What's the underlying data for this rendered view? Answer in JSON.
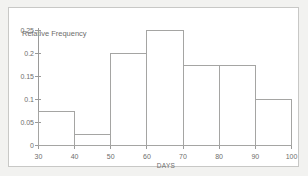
{
  "chart_data": {
    "type": "bar",
    "title": "",
    "subtitle": "",
    "xlabel": "DAYS",
    "ylabel": "Relative Frequency",
    "categories": [
      "30-40",
      "40-50",
      "50-60",
      "60-70",
      "70-80",
      "80-90",
      "90-100"
    ],
    "bin_edges": [
      30,
      40,
      50,
      60,
      70,
      80,
      90,
      100
    ],
    "values": [
      0.075,
      0.025,
      0.2,
      0.25,
      0.175,
      0.175,
      0.1
    ],
    "xlim": [
      30,
      100
    ],
    "ylim": [
      0,
      0.25
    ],
    "xticks": [
      "30",
      "40",
      "50",
      "60",
      "70",
      "80",
      "90",
      "100"
    ],
    "xtick_values": [
      30,
      40,
      50,
      60,
      70,
      80,
      90,
      100
    ],
    "yticks": [
      "0",
      "0.05",
      "0.1",
      "0.15",
      "0.2",
      "0.25"
    ],
    "ytick_values": [
      0,
      0.05,
      0.1,
      0.15,
      0.2,
      0.25
    ],
    "grid": false,
    "legend": null,
    "bar_fill": "none",
    "bar_stroke": "#a5a5a3",
    "axis_color": "#9a9a99",
    "text_color": "#6e6e6c",
    "plot_background": "#ffffff",
    "page_background": "#f2f2f0"
  }
}
